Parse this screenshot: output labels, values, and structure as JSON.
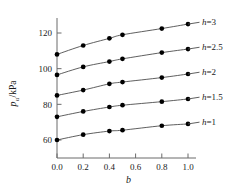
{
  "chart_data": {
    "type": "line",
    "title": "",
    "xlabel": "b",
    "ylabel": "p_u/kPa",
    "ylabel_main": "p",
    "ylabel_sub": "u",
    "ylabel_unit": "/kPa",
    "x": [
      0.0,
      0.2,
      0.4,
      0.5,
      0.8,
      1.0
    ],
    "xlim": [
      -0.05,
      1.08
    ],
    "ylim": [
      50,
      131
    ],
    "xticks": [
      0.0,
      0.2,
      0.4,
      0.6,
      0.8,
      1.0
    ],
    "xticklabels": [
      "0.0",
      "0.2",
      "0.4",
      "0.6",
      "0.8",
      "1.0"
    ],
    "yticks": [
      60,
      80,
      100,
      120
    ],
    "yticklabels": [
      "60",
      "80",
      "100",
      "120"
    ],
    "grid": false,
    "legend_position": "right-inline-annotations",
    "marker": "filled-circle",
    "series": [
      {
        "name": "h=3",
        "label_prefix": "h",
        "label_suffix": "=3",
        "values": [
          108,
          113,
          117,
          119,
          122.5,
          125
        ]
      },
      {
        "name": "h=2.5",
        "label_prefix": "h",
        "label_suffix": "=2.5",
        "values": [
          96.5,
          101,
          104,
          105.5,
          109,
          111
        ]
      },
      {
        "name": "h=2",
        "label_prefix": "h",
        "label_suffix": "=2",
        "values": [
          85,
          88,
          91.5,
          92.5,
          95,
          97
        ]
      },
      {
        "name": "h=1.5",
        "label_prefix": "h",
        "label_suffix": "=1.5",
        "values": [
          73,
          76,
          78.5,
          79.5,
          81.5,
          83
        ]
      },
      {
        "name": "h=1",
        "label_prefix": "h",
        "label_suffix": "=1",
        "values": [
          60,
          63,
          65,
          65.5,
          68,
          69
        ]
      }
    ]
  }
}
